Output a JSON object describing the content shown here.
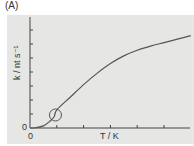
{
  "figure": {
    "panel_label": "(A)",
    "background_color": "#e6e6e4",
    "line_color": "#555555"
  },
  "chart_data": {
    "type": "line",
    "title": "",
    "panel": "(A)",
    "xlabel": "T / K",
    "ylabel": "k / nt s⁻¹",
    "x_origin_label": "0",
    "y_origin_label": "0",
    "x_ticks_count": 6,
    "y_ticks_count": 7,
    "grid": false,
    "legend": null,
    "x": [
      0,
      0.2,
      0.5,
      0.75,
      0.9,
      1.0,
      1.5,
      2.0,
      2.5,
      3.0,
      3.5,
      4.0,
      4.5,
      5.0,
      5.5,
      6.0
    ],
    "y": [
      0,
      0.02,
      0.15,
      0.5,
      0.8,
      1.3,
      2.2,
      3.1,
      3.9,
      4.6,
      5.15,
      5.55,
      5.85,
      6.1,
      6.35,
      6.6
    ],
    "x_units": "tick spacing",
    "y_units": "tick spacing",
    "annotations": [
      {
        "type": "circle",
        "x": 0.95,
        "y": 1.0,
        "note": "inflection point marked by open circle"
      }
    ],
    "axis_ranges": {
      "x": [
        0,
        6
      ],
      "y": [
        0,
        7.8
      ]
    }
  }
}
